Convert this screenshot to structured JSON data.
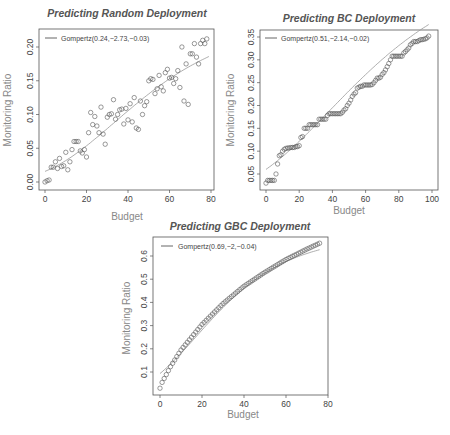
{
  "chart_data": [
    {
      "type": "scatter",
      "title": "Predicting Random Deployment",
      "xlabel": "Budget",
      "ylabel": "Monitoring Ratio",
      "xlim": [
        0,
        80
      ],
      "ylim": [
        0.0,
        0.21
      ],
      "xticks": [
        0,
        20,
        40,
        60,
        80
      ],
      "yticks": [
        0.0,
        0.05,
        0.1,
        0.15,
        0.2
      ],
      "ytick_labels": [
        "0.00",
        "0.05",
        "0.10",
        "0.15",
        "0.20"
      ],
      "grid": false,
      "legend": {
        "position": "top-left",
        "entries": [
          "Gompertz(0.24,−2.73,−0.03)"
        ]
      },
      "fit": {
        "name": "Gompertz",
        "a": 0.24,
        "b": -2.73,
        "c": -0.03
      },
      "series": [
        {
          "name": "observed",
          "marker": "open-circle",
          "x": [
            0,
            1,
            2,
            3,
            4,
            5,
            6,
            7,
            8,
            9,
            10,
            11,
            12,
            13,
            14,
            15,
            16,
            17,
            18,
            19,
            20,
            21,
            22,
            23,
            24,
            25,
            26,
            27,
            28,
            29,
            30,
            31,
            32,
            33,
            34,
            35,
            36,
            37,
            38,
            39,
            40,
            41,
            42,
            43,
            44,
            45,
            46,
            47,
            48,
            49,
            50,
            51,
            52,
            53,
            54,
            55,
            56,
            57,
            58,
            59,
            60,
            61,
            62,
            63,
            64,
            65,
            66,
            67,
            68,
            69,
            70,
            71,
            72,
            73,
            74,
            75,
            76,
            77,
            78
          ],
          "y": [
            0.0,
            0.002,
            0.003,
            0.022,
            0.022,
            0.03,
            0.02,
            0.035,
            0.023,
            0.024,
            0.044,
            0.018,
            0.03,
            0.048,
            0.06,
            0.06,
            0.06,
            0.046,
            0.043,
            0.048,
            0.037,
            0.073,
            0.103,
            0.085,
            0.097,
            0.083,
            0.073,
            0.111,
            0.071,
            0.056,
            0.096,
            0.1,
            0.101,
            0.122,
            0.093,
            0.1,
            0.107,
            0.108,
            0.086,
            0.109,
            0.092,
            0.116,
            0.089,
            0.125,
            0.08,
            0.078,
            0.12,
            0.1,
            0.113,
            0.119,
            0.15,
            0.153,
            0.152,
            0.131,
            0.138,
            0.158,
            0.141,
            0.135,
            0.162,
            0.167,
            0.154,
            0.155,
            0.146,
            0.153,
            0.165,
            0.14,
            0.2,
            0.12,
            0.175,
            0.115,
            0.19,
            0.19,
            0.205,
            0.185,
            0.175,
            0.205,
            0.21,
            0.205,
            0.212
          ]
        }
      ]
    },
    {
      "type": "scatter",
      "title": "Predicting BC Deployment",
      "xlabel": "Budget",
      "ylabel": "Monitoring Ratio",
      "xlim": [
        0,
        100
      ],
      "ylim": [
        0.02,
        0.36
      ],
      "xticks": [
        0,
        20,
        40,
        60,
        80,
        100
      ],
      "yticks": [
        0.05,
        0.1,
        0.15,
        0.2,
        0.25,
        0.3,
        0.35
      ],
      "ytick_labels": [
        "0.05",
        "0.10",
        "0.15",
        "0.20",
        "0.25",
        "0.30",
        "0.35"
      ],
      "grid": false,
      "legend": {
        "position": "top-left",
        "entries": [
          "Gompertz(0.51,−2.14,−0.02)"
        ]
      },
      "fit": {
        "name": "Gompertz",
        "a": 0.51,
        "b": -2.14,
        "c": -0.02
      },
      "series": [
        {
          "name": "observed",
          "marker": "open-circle",
          "x": [
            0,
            1,
            2,
            3,
            4,
            5,
            6,
            7,
            8,
            9,
            10,
            11,
            12,
            13,
            14,
            15,
            16,
            17,
            18,
            19,
            20,
            21,
            22,
            23,
            24,
            25,
            26,
            27,
            28,
            29,
            30,
            31,
            32,
            33,
            34,
            35,
            36,
            37,
            38,
            39,
            40,
            41,
            42,
            43,
            44,
            45,
            46,
            47,
            48,
            49,
            50,
            51,
            52,
            53,
            54,
            55,
            56,
            57,
            58,
            59,
            60,
            61,
            62,
            63,
            64,
            65,
            66,
            67,
            68,
            69,
            70,
            71,
            72,
            73,
            74,
            75,
            76,
            77,
            78,
            79,
            80,
            81,
            82,
            83,
            84,
            85,
            86,
            87,
            88,
            89,
            90,
            91,
            92,
            93,
            94,
            95,
            96,
            97,
            98
          ],
          "y": [
            0.03,
            0.036,
            0.036,
            0.036,
            0.036,
            0.036,
            0.05,
            0.072,
            0.09,
            0.092,
            0.1,
            0.104,
            0.106,
            0.107,
            0.107,
            0.108,
            0.108,
            0.108,
            0.11,
            0.11,
            0.112,
            0.13,
            0.132,
            0.15,
            0.15,
            0.15,
            0.158,
            0.158,
            0.158,
            0.158,
            0.158,
            0.158,
            0.17,
            0.17,
            0.17,
            0.17,
            0.17,
            0.178,
            0.182,
            0.182,
            0.182,
            0.182,
            0.182,
            0.182,
            0.182,
            0.182,
            0.185,
            0.19,
            0.193,
            0.2,
            0.205,
            0.212,
            0.22,
            0.225,
            0.228,
            0.238,
            0.24,
            0.242,
            0.242,
            0.245,
            0.245,
            0.245,
            0.245,
            0.245,
            0.246,
            0.25,
            0.255,
            0.26,
            0.26,
            0.262,
            0.268,
            0.272,
            0.278,
            0.285,
            0.292,
            0.3,
            0.308,
            0.308,
            0.308,
            0.308,
            0.308,
            0.308,
            0.308,
            0.315,
            0.318,
            0.322,
            0.326,
            0.333,
            0.336,
            0.34,
            0.34,
            0.34,
            0.342,
            0.344,
            0.344,
            0.345,
            0.346,
            0.348,
            0.352
          ]
        }
      ]
    },
    {
      "type": "scatter",
      "title": "Predicting GBC Deployment",
      "xlabel": "Budget",
      "ylabel": "Monitoring Ratio",
      "xlim": [
        0,
        80
      ],
      "ylim": [
        0.0,
        0.66
      ],
      "xticks": [
        0,
        20,
        40,
        60,
        80
      ],
      "yticks": [
        0.1,
        0.2,
        0.3,
        0.4,
        0.5,
        0.6
      ],
      "ytick_labels": [
        "0.1",
        "0.2",
        "0.3",
        "0.4",
        "0.5",
        "0.6"
      ],
      "grid": false,
      "legend": {
        "position": "top-left",
        "entries": [
          "Gompertz(0.69,−2,−0.04)"
        ]
      },
      "fit": {
        "name": "Gompertz",
        "a": 0.69,
        "b": -2,
        "c": -0.04
      },
      "series": [
        {
          "name": "observed",
          "marker": "open-circle",
          "note": "one point per integer budget 0..76, following a smooth concave curve",
          "x_start": 0,
          "x_end": 76,
          "y_samples": {
            "0": 0.03,
            "1": 0.055,
            "2": 0.072,
            "5": 0.123,
            "10": 0.195,
            "20": 0.305,
            "30": 0.395,
            "40": 0.47,
            "50": 0.53,
            "60": 0.585,
            "70": 0.63,
            "76": 0.655
          }
        }
      ]
    }
  ],
  "panels": [
    {
      "id": "random",
      "title": "Predicting Random Deployment",
      "xlabel": "Budget",
      "ylabel": "Monitoring Ratio",
      "legend": "Gompertz(0.24,−2.73,−0.03)"
    },
    {
      "id": "bc",
      "title": "Predicting BC Deployment",
      "xlabel": "Budget",
      "ylabel": "Monitoring Ratio",
      "legend": "Gompertz(0.51,−2.14,−0.02)"
    },
    {
      "id": "gbc",
      "title": "Predicting GBC Deployment",
      "xlabel": "Budget",
      "ylabel": "Monitoring Ratio",
      "legend": "Gompertz(0.69,−2,−0.04)"
    }
  ],
  "colors": {
    "points": "#555555",
    "fit_line": "#888888",
    "frame": "#555555",
    "title": "#555555",
    "axis_label": "#888888"
  }
}
